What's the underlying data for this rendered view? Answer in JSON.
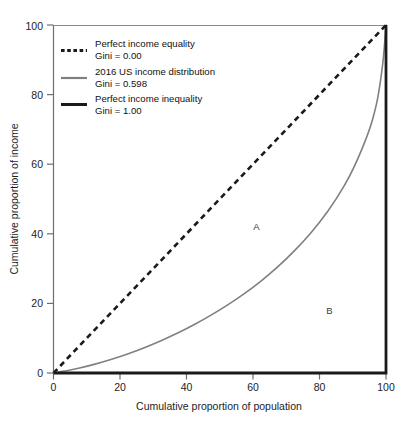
{
  "chart_data": {
    "type": "line",
    "title": "",
    "xlabel": "Cumulative proportion of population",
    "ylabel": "Cumulative proportion of income",
    "xlim": [
      0,
      100
    ],
    "ylim": [
      0,
      100
    ],
    "xticks": [
      0,
      20,
      40,
      60,
      80,
      100
    ],
    "yticks": [
      0,
      20,
      40,
      60,
      80,
      100
    ],
    "grid": false,
    "legend_position": "upper-left-inside",
    "annotations": [
      {
        "text": "A",
        "x": 61,
        "y": 41
      },
      {
        "text": "B",
        "x": 83,
        "y": 17
      }
    ],
    "series": [
      {
        "name": "Perfect income equality",
        "gini": "0.00",
        "style": "dashed",
        "color": "#1a1a1a",
        "width": 2.6,
        "x": [
          0,
          10,
          20,
          30,
          40,
          50,
          60,
          70,
          80,
          90,
          100
        ],
        "values": [
          0,
          10,
          20,
          30,
          40,
          50,
          60,
          70,
          80,
          90,
          100
        ]
      },
      {
        "name": "2016 US income distribution",
        "gini": "0.598",
        "style": "solid",
        "color": "#808080",
        "width": 1.6,
        "x": [
          0,
          5,
          10,
          15,
          20,
          25,
          30,
          35,
          40,
          45,
          50,
          55,
          60,
          65,
          70,
          75,
          80,
          85,
          90,
          95,
          97,
          98,
          99,
          99.5,
          100
        ],
        "values": [
          0,
          0.8,
          1.9,
          3.2,
          4.7,
          6.4,
          8.3,
          10.4,
          12.7,
          15.3,
          18.1,
          21.2,
          24.6,
          28.4,
          32.7,
          37.6,
          43.2,
          49.8,
          58.0,
          69.5,
          76.5,
          81.5,
          88.5,
          93.5,
          100
        ]
      },
      {
        "name": "Perfect income inequality",
        "gini": "1.00",
        "style": "solid",
        "color": "#1a1a1a",
        "width": 2.8,
        "x": [
          0,
          100,
          100
        ],
        "values": [
          0,
          0,
          100
        ]
      }
    ]
  },
  "legend": {
    "entries": [
      {
        "label": "Perfect income equality",
        "sub": "Gini = 0.00",
        "swatch": "dashed-black"
      },
      {
        "label": "2016 US income distribution",
        "sub": "Gini = 0.598",
        "swatch": "solid-gray"
      },
      {
        "label": "Perfect income inequality",
        "sub": "Gini = 1.00",
        "swatch": "solid-black-thick"
      }
    ]
  },
  "axes": {
    "x_label": "Cumulative proportion of population",
    "y_label": "Cumulative proportion of income",
    "x_ticks": [
      "0",
      "20",
      "40",
      "60",
      "80",
      "100"
    ],
    "y_ticks": [
      "0",
      "20",
      "40",
      "60",
      "80",
      "100"
    ]
  },
  "regions": {
    "a": "A",
    "b": "B"
  },
  "colors": {
    "axis": "#6e6e6e",
    "equality": "#1a1a1a",
    "lorenz": "#808080",
    "inequality": "#1a1a1a",
    "text": "#1d1d1d"
  }
}
